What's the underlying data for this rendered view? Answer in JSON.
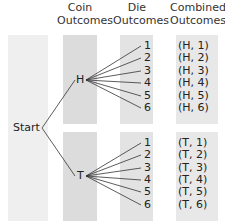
{
  "headers": {
    "coin": [
      "Coin",
      "Outcomes"
    ],
    "die": [
      "Die",
      "Outcomes"
    ],
    "combined": [
      "Combined",
      "Outcomes"
    ]
  },
  "nodes": {
    "start": "Start",
    "heads": "H",
    "tails": "T"
  },
  "die_outcomes": [
    "1",
    "2",
    "3",
    "4",
    "5",
    "6"
  ],
  "combined_outcomes": {
    "heads": [
      "(H, 1)",
      "(H, 2)",
      "(H, 3)",
      "(H, 4)",
      "(H, 5)",
      "(H, 6)"
    ],
    "tails": [
      "(T, 1)",
      "(T, 2)",
      "(T, 3)",
      "(T, 4)",
      "(T, 5)",
      "(T, 6)"
    ]
  },
  "colors": {
    "start_column": "#efefef",
    "coin_column": "#dcdcdc",
    "die_column": "#e3e3e3",
    "combined_column": "#e8e8e8",
    "lines": "#333333"
  }
}
